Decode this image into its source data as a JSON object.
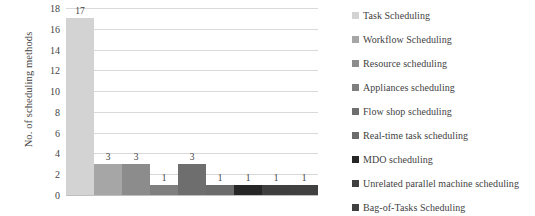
{
  "chart_data": {
    "type": "bar",
    "title": "",
    "xlabel": "",
    "ylabel": "No. of scheduling methods",
    "ylim": [
      0,
      18
    ],
    "ytick_step": 2,
    "yticks": [
      18,
      16,
      14,
      12,
      10,
      8,
      6,
      4,
      2,
      0
    ],
    "grid": true,
    "legend_position": "right",
    "categories": [
      "Task Scheduling",
      "Workflow Scheduling",
      "Resource scheduling",
      "Appliances scheduling",
      "Flow shop scheduling",
      "Real-time task scheduling",
      "MDO scheduling",
      "Unrelated parallel machine scheduling",
      "Bag-of-Tasks Scheduling"
    ],
    "values": [
      17,
      3,
      3,
      1,
      3,
      1,
      1,
      1,
      1
    ],
    "data_labels": [
      "17",
      "3",
      "3",
      "1",
      "3",
      "1",
      "1",
      "1",
      "1"
    ],
    "colors": [
      "#d3d3d3",
      "#a6a6a6",
      "#8c8c8c",
      "#7f7f7f",
      "#6e6e6e",
      "#6b6b6b",
      "#262626",
      "#3f3f3f",
      "#404040"
    ]
  },
  "legend": {
    "items": [
      {
        "label": "Task Scheduling",
        "color": "#d3d3d3"
      },
      {
        "label": "Workflow Scheduling",
        "color": "#a6a6a6"
      },
      {
        "label": "Resource scheduling",
        "color": "#8c8c8c"
      },
      {
        "label": "Appliances scheduling",
        "color": "#7f7f7f"
      },
      {
        "label": "Flow shop scheduling",
        "color": "#6e6e6e"
      },
      {
        "label": "Real-time task scheduling",
        "color": "#6b6b6b"
      },
      {
        "label": "MDO scheduling",
        "color": "#262626"
      },
      {
        "label": "Unrelated parallel machine scheduling",
        "color": "#3f3f3f"
      },
      {
        "label": "Bag-of-Tasks Scheduling",
        "color": "#404040"
      }
    ]
  },
  "axis": {
    "y_title": "No. of scheduling methods"
  }
}
